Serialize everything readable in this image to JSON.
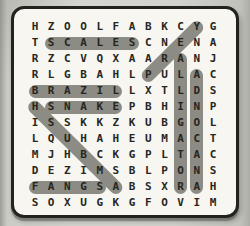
{
  "puzzle": {
    "type": "word-search",
    "grid_size": {
      "rows": 12,
      "cols": 12
    },
    "grid": [
      "HZOOLFABKCYG",
      "TSCALESCNENA",
      "RZCVQXAARANJ",
      "RLGBAHLPULAC",
      "BRAZILLXTLDS",
      "HSNAKEPBHINP",
      "ISSKKZKUBGOL",
      "LQUHAHEUMACT",
      "MJHBCKGPLTAC",
      "DEZIMSBLPONS",
      "FANGSABSXRAH",
      "SOXUGKGFOVIM"
    ],
    "found_words": [
      {
        "word": "SCALES",
        "direction": "horizontal",
        "start": {
          "row": 1,
          "col": 1
        },
        "end": {
          "row": 1,
          "col": 6
        }
      },
      {
        "word": "BRAZIL",
        "direction": "horizontal",
        "start": {
          "row": 4,
          "col": 0
        },
        "end": {
          "row": 4,
          "col": 5
        }
      },
      {
        "word": "SNAKE",
        "direction": "horizontal",
        "start": {
          "row": 5,
          "col": 1
        },
        "end": {
          "row": 5,
          "col": 5
        }
      },
      {
        "word": "FANGS",
        "direction": "horizontal",
        "start": {
          "row": 10,
          "col": 0
        },
        "end": {
          "row": 10,
          "col": 4
        }
      },
      {
        "word": "PREY",
        "direction": "diagonal-up-right",
        "start": {
          "row": 3,
          "col": 7
        },
        "end": {
          "row": 0,
          "col": 10
        }
      },
      {
        "word": "AMBUSH",
        "direction": "diagonal-up-left",
        "start": {
          "row": 10,
          "col": 5
        },
        "end": {
          "row": 5,
          "col": 0
        }
      },
      {
        "word": "ALLIGATOR",
        "direction": "vertical-down",
        "start": {
          "row": 2,
          "col": 9
        },
        "end": {
          "row": 10,
          "col": 9
        }
      },
      {
        "word": "ANACONDA",
        "direction": "vertical-up",
        "start": {
          "row": 10,
          "col": 10
        },
        "end": {
          "row": 3,
          "col": 10
        }
      }
    ],
    "colors": {
      "page_background": "#d3d3ce",
      "board_background": "#f7f6f1",
      "board_border": "#22221f",
      "highlight": "#8c8c85",
      "letter": "#26261f"
    }
  }
}
